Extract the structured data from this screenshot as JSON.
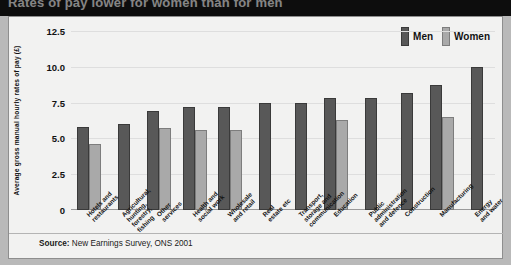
{
  "title": "Rates of pay lower for women than for men",
  "legend": {
    "position": "top-right",
    "entries": [
      {
        "label": "Men",
        "color": "#585858"
      },
      {
        "label": "Women",
        "color": "#a9a9a9"
      }
    ]
  },
  "source": {
    "prefix": "Source:",
    "text": "New Earnings Survey, ONS 2001"
  },
  "chart_data": {
    "type": "bar",
    "title": "Rates of pay lower for women than for men",
    "xlabel": "",
    "ylabel": "Average gross manual hourly rates of pay (£)",
    "ylim": [
      0,
      12.5
    ],
    "yticks": [
      "0",
      "2.5",
      "5.0",
      "7.5",
      "10.0",
      "12.5"
    ],
    "ytick_values": [
      0,
      2.5,
      5.0,
      7.5,
      10.0,
      12.5
    ],
    "grid": true,
    "categories": [
      "Hotels and\nrestaurants",
      "Agricultural,\nhunting,\nforestry,\nfishing",
      "Other\nservices",
      "Health and\nsocial work",
      "Wholesale\nand retail",
      "Real\nestate etc",
      "Transport,\nstorage and\ncommunication",
      "Education",
      "Public\nadministration\nand defence",
      "Construction",
      "Manufacturing",
      "Energy\nand water"
    ],
    "series": [
      {
        "name": "Men",
        "color": "#585858",
        "values": [
          5.8,
          6.0,
          6.9,
          7.2,
          7.2,
          7.5,
          7.5,
          7.8,
          7.8,
          8.2,
          8.7,
          10.0
        ]
      },
      {
        "name": "Women",
        "color": "#a9a9a9",
        "values": [
          4.6,
          null,
          5.7,
          5.6,
          5.6,
          null,
          null,
          6.3,
          null,
          null,
          6.5,
          null
        ]
      }
    ]
  }
}
